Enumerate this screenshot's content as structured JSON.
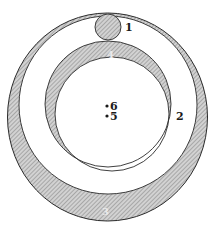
{
  "figure": {
    "colors": {
      "stroke": "#2a2a2a",
      "hatch_fill": "#b8b8b8",
      "background": "#ffffff"
    },
    "labels": [
      {
        "id": "1",
        "text": "1",
        "x": 125,
        "y": 31
      },
      {
        "id": "2",
        "text": "2",
        "x": 176,
        "y": 120
      },
      {
        "id": "3",
        "text": "3",
        "x": 102,
        "y": 215
      },
      {
        "id": "4",
        "text": "4",
        "x": 107,
        "y": 58
      },
      {
        "id": "5",
        "text": "5",
        "x": 110,
        "y": 120
      },
      {
        "id": "6",
        "text": "6",
        "x": 110,
        "y": 110
      }
    ],
    "points": [
      {
        "id": "6",
        "cx": 107,
        "cy": 106
      },
      {
        "id": "5",
        "cx": 107,
        "cy": 116
      }
    ]
  }
}
